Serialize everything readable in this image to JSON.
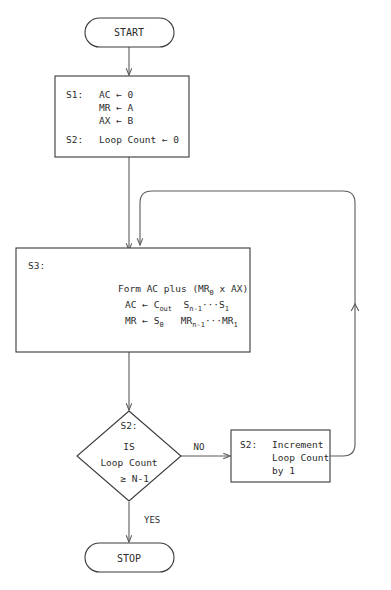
{
  "diagram": {
    "background_color": "#ffffff",
    "line_color": "#5a5a5a",
    "text_color": "#2b2b2b"
  },
  "nodes": {
    "start": {
      "type": "terminal",
      "label": "START"
    },
    "init": {
      "type": "process",
      "lines": [
        {
          "state": "S1:",
          "text": "AC ← 0"
        },
        {
          "state": "",
          "text": "MR ← A"
        },
        {
          "state": "",
          "text": "AX ← B"
        },
        {
          "state": "S2:",
          "text": "Loop Count ← 0"
        }
      ]
    },
    "form": {
      "type": "process",
      "state": "S3:",
      "lines": [
        {
          "main": "Form AC plus (MR",
          "sub": "0",
          "tail": " x AX)"
        },
        {
          "lhs": "AC ← C",
          "lhs_sub": "out",
          "rhs": "S",
          "rhs_sub": "n-1",
          "dots": "···",
          "rhs2": "S",
          "rhs2_sub": "1"
        },
        {
          "lhs": "MR ← S",
          "lhs_sub": "0",
          "rhs": "MR",
          "rhs_sub": "n-1",
          "dots": "···",
          "rhs2": "MR",
          "rhs2_sub": "1"
        }
      ]
    },
    "decision": {
      "type": "decision",
      "state": "S2:",
      "lines": [
        "IS",
        "Loop Count"
      ],
      "compare_op": "≥",
      "compare_value": "N-1"
    },
    "increment": {
      "type": "process",
      "lines": [
        {
          "state": "S2:",
          "text": "Increment"
        },
        {
          "state": "",
          "text": "Loop Count"
        },
        {
          "state": "",
          "text": "by 1"
        }
      ]
    },
    "stop": {
      "type": "terminal",
      "label": "STOP"
    }
  },
  "edges": {
    "no_label": "NO",
    "yes_label": "YES"
  }
}
